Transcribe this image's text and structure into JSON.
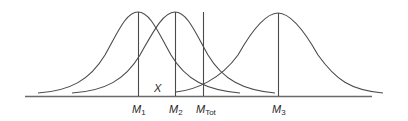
{
  "diagram": {
    "type": "overlapping-normal-distributions",
    "curves": [
      {
        "name": "distribution-1",
        "mean_label": "M",
        "mean_sub": "1",
        "mean_x": 138,
        "peak_y": 12
      },
      {
        "name": "distribution-2",
        "mean_label": "M",
        "mean_sub": "2",
        "mean_x": 175,
        "peak_y": 12
      },
      {
        "name": "distribution-3",
        "mean_label": "M",
        "mean_sub": "3",
        "mean_x": 278,
        "peak_y": 13
      }
    ],
    "total_mean": {
      "label": "M",
      "sub": "Tot",
      "x": 203
    },
    "region_label": "X",
    "colors": {
      "line": "#4a4a4a",
      "axis": "#6a6a6a",
      "text": "#2a2a2a",
      "background": "#ffffff"
    }
  },
  "labels": {
    "x": "X",
    "m1": "M",
    "m1_sub": "1",
    "m2": "M",
    "m2_sub": "2",
    "mtot": "M",
    "mtot_sub": "Tot",
    "m3": "M",
    "m3_sub": "3"
  }
}
